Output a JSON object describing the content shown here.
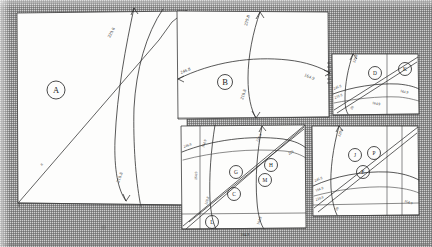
{
  "sheet": {
    "title": "Scanned survey plot sheet",
    "background_color": "#cfcfcf",
    "paper_color": "#fdfdfc",
    "ink_color": "#2e2e2e",
    "width": 432,
    "height": 247,
    "bottom_label": "164.9"
  },
  "panels": [
    {
      "id": "panel-a",
      "marker": "A",
      "x": 16,
      "y": 12,
      "w": 170,
      "h": 192,
      "annotations": [
        "229.8",
        "8",
        "218.8"
      ]
    },
    {
      "id": "panel-b",
      "marker": "B",
      "x": 176,
      "y": 10,
      "w": 152,
      "h": 108,
      "annotations": [
        "246.8",
        "164.9",
        "229.8",
        "218.8"
      ]
    },
    {
      "id": "panel-d-k",
      "marker": "D",
      "marker2": "K",
      "x": 331,
      "y": 53,
      "w": 88,
      "h": 62,
      "annotations": [
        "229.8",
        "246.8",
        "164.9",
        "164.9",
        "218.8",
        "28"
      ]
    },
    {
      "id": "panel-g-h-m-c",
      "marker": "G",
      "markers": [
        "G",
        "H",
        "M",
        "C",
        "L"
      ],
      "x": 180,
      "y": 124,
      "w": 125,
      "h": 104,
      "annotations": [
        "246.8",
        "164.9",
        "164.9",
        "229.8",
        "218.8",
        "229",
        "218.8",
        "164.9"
      ]
    },
    {
      "id": "panel-j-p-e",
      "markers": [
        "J",
        "P",
        "E"
      ],
      "x": 311,
      "y": 124,
      "w": 108,
      "h": 92,
      "annotations": [
        "229.8",
        "246.8",
        "164.9",
        "218.8",
        "28",
        "164.9"
      ]
    }
  ],
  "markers": {
    "a": "A",
    "b": "B",
    "d": "D",
    "k": "K",
    "g": "G",
    "h": "H",
    "m": "M",
    "c": "C",
    "l": "L",
    "j": "J",
    "p": "P",
    "e": "E"
  },
  "labels": {
    "a_curve": "229.8",
    "a_left": "8",
    "a_bottom": "218.8",
    "b_left": "246.8",
    "b_top": "229.8",
    "b_right": "164.9",
    "b_bottom": "218.8",
    "dk_top": "229.8",
    "dk_left": "246.8",
    "dk_left2": "218.8",
    "dk_right": "164.9",
    "dk_mid": "164.9",
    "dk_bottom": "28",
    "ghm_left": "246.8",
    "ghm_v1": "164.9",
    "ghm_v2": "164.9",
    "ghm_top": "229.8",
    "ghm_right": "229",
    "ghm_bottom": "218.8",
    "ghm_bl": "164.9",
    "jpe_top": "229.8",
    "jpe_left": "246.8",
    "jpe_left2": "164.9",
    "jpe_left3": "218.8",
    "jpe_bottom": "28",
    "jpe_right": "164.9",
    "sheet_bottom": "164.9"
  }
}
